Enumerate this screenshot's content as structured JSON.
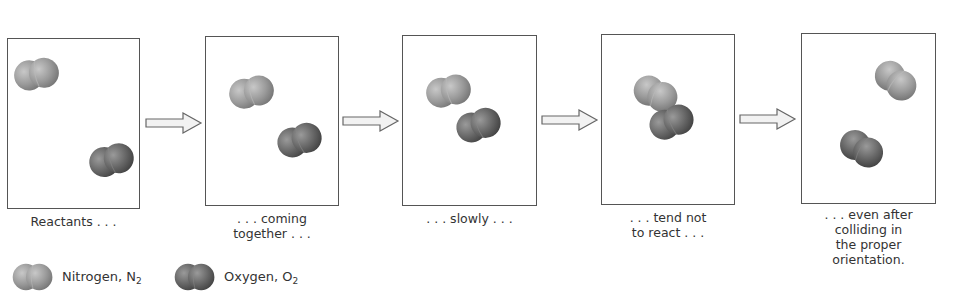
{
  "colors": {
    "nitrogen": "#9a9a9a",
    "oxygen": "#6a6a6a",
    "panel_border": "#555555",
    "arrow_fill": "#f2f2f2",
    "arrow_stroke": "#666666"
  },
  "panels": [
    {
      "caption": "Reactants . . ."
    },
    {
      "caption": ". . . coming\ntogether . . ."
    },
    {
      "caption": ". . . slowly . . ."
    },
    {
      "caption": ". . . tend not\nto react . . ."
    },
    {
      "caption": ". . . even after\ncolliding in\nthe proper\norientation."
    }
  ],
  "legend": {
    "nitrogen": {
      "label": "Nitrogen, N",
      "subscript": "2",
      "icon": "nitrogen-molecule-icon"
    },
    "oxygen": {
      "label": "Oxygen, O",
      "subscript": "2",
      "icon": "oxygen-molecule-icon"
    }
  }
}
